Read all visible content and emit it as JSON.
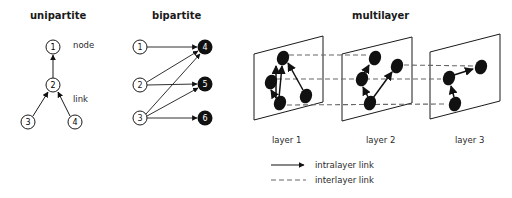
{
  "panels": {
    "unipartite": {
      "title": "unipartite",
      "annotations": {
        "node": "node",
        "link": "link"
      },
      "nodes": [
        {
          "id": "1",
          "label": "1",
          "x": 53,
          "y": 47
        },
        {
          "id": "2",
          "label": "2",
          "x": 53,
          "y": 85
        },
        {
          "id": "3",
          "label": "3",
          "x": 28,
          "y": 122
        },
        {
          "id": "4",
          "label": "4",
          "x": 75,
          "y": 122
        }
      ],
      "edges": [
        {
          "from": "2",
          "to": "1"
        },
        {
          "from": "3",
          "to": "2"
        },
        {
          "from": "4",
          "to": "2"
        }
      ]
    },
    "bipartite": {
      "title": "bipartite",
      "nodes": [
        {
          "id": "1",
          "label": "1",
          "x": 140,
          "y": 47,
          "filled": false
        },
        {
          "id": "2",
          "label": "2",
          "x": 140,
          "y": 85,
          "filled": false
        },
        {
          "id": "3",
          "label": "3",
          "x": 140,
          "y": 118,
          "filled": false
        },
        {
          "id": "4",
          "label": "4",
          "x": 205,
          "y": 47,
          "filled": true
        },
        {
          "id": "5",
          "label": "5",
          "x": 205,
          "y": 84,
          "filled": true
        },
        {
          "id": "6",
          "label": "6",
          "x": 205,
          "y": 118,
          "filled": true
        }
      ],
      "edges": [
        {
          "from": "1",
          "to": "4"
        },
        {
          "from": "2",
          "to": "4"
        },
        {
          "from": "2",
          "to": "5"
        },
        {
          "from": "3",
          "to": "4"
        },
        {
          "from": "3",
          "to": "5"
        },
        {
          "from": "3",
          "to": "6"
        }
      ]
    },
    "multilayer": {
      "title": "multilayer",
      "layers": [
        {
          "label": "layer 1"
        },
        {
          "label": "layer 2"
        },
        {
          "label": "layer 3"
        }
      ],
      "legend": {
        "intralayer": "intralayer link",
        "interlayer": "interlayer link"
      }
    }
  },
  "colors": {
    "stroke": "#1a1a1a",
    "node_fill_dark": "#111111",
    "dash": "#666666"
  }
}
